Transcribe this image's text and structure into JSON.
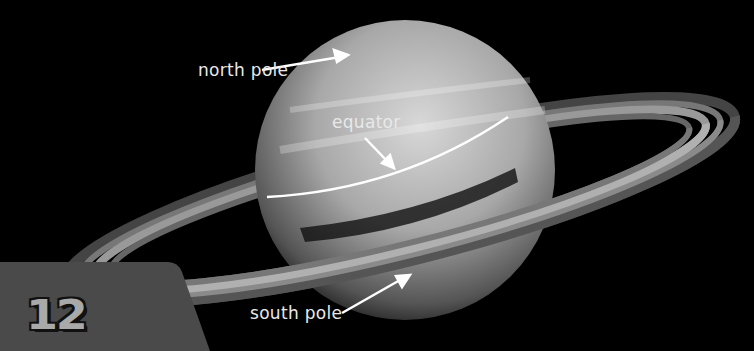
{
  "image": {
    "subject": "Saturn with rings",
    "background_color": "#000000"
  },
  "labels": {
    "north_pole": "north pole",
    "equator": "equator",
    "south_pole": "south pole"
  },
  "page": {
    "number": "12",
    "box_color": "#4a4a4a",
    "number_color": "#a9a9a9"
  }
}
